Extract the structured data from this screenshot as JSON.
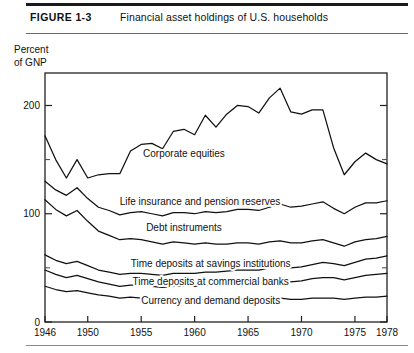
{
  "figure": {
    "number_label": "FIGURE 1-3",
    "title": "Financial asset holdings of U.S. households"
  },
  "chart_data": {
    "type": "area",
    "title": "Financial asset holdings of U.S. households",
    "subtitle": "",
    "xlabel": "",
    "ylabel": "Percent of GNP",
    "ylabel_display": "Percent\nof GNP",
    "xlim": [
      1946,
      1978
    ],
    "ylim": [
      0,
      230
    ],
    "grid": false,
    "legend_position": "inline-annotations",
    "ytick_labels": [
      "0",
      "100",
      "200"
    ],
    "ytick_values": [
      0,
      100,
      200
    ],
    "yminor_ticks": [
      50,
      150
    ],
    "xtick_labels": [
      "1946",
      "1950",
      "1955",
      "1960",
      "1965",
      "1970",
      "1975",
      "1978"
    ],
    "xtick_values": [
      1946,
      1950,
      1955,
      1960,
      1965,
      1970,
      1975,
      1978
    ],
    "x": [
      1946,
      1947,
      1948,
      1949,
      1950,
      1951,
      1952,
      1953,
      1954,
      1955,
      1956,
      1957,
      1958,
      1959,
      1960,
      1961,
      1962,
      1963,
      1964,
      1965,
      1966,
      1967,
      1968,
      1969,
      1970,
      1971,
      1972,
      1973,
      1974,
      1975,
      1976,
      1977,
      1978
    ],
    "note": "Cumulative boundary curves; each series value is the running top of the stacked band, in percent of GNP.",
    "series": [
      {
        "name": "Corporate equities",
        "label": "Corporate equities",
        "label_at": {
          "x": 1959.0,
          "y": 152
        },
        "cumulative_top": [
          172,
          150,
          133,
          150,
          133,
          136,
          137,
          137,
          158,
          164,
          165,
          160,
          176,
          178,
          173,
          191,
          180,
          192,
          200,
          199,
          193,
          207,
          216,
          194,
          192,
          196,
          196,
          161,
          136,
          148,
          156,
          150,
          146
        ]
      },
      {
        "name": "Life insurance and pension reserves",
        "label": "Life insurance and pension reserves",
        "label_at": {
          "x": 1960.5,
          "y": 108
        },
        "cumulative_top": [
          130,
          122,
          117,
          124,
          114,
          106,
          103,
          99,
          101,
          102,
          100,
          98,
          101,
          101,
          100,
          102,
          101,
          102,
          104,
          104,
          103,
          106,
          109,
          106,
          107,
          109,
          111,
          105,
          100,
          106,
          110,
          110,
          112
        ]
      },
      {
        "name": "Debt instruments",
        "label": "Debt instruments",
        "label_at": {
          "x": 1959.0,
          "y": 84
        },
        "cumulative_top": [
          113,
          104,
          98,
          103,
          93,
          84,
          80,
          76,
          77,
          76,
          74,
          72,
          74,
          73,
          72,
          73,
          72,
          72,
          73,
          73,
          72,
          74,
          75,
          73,
          73,
          75,
          76,
          73,
          70,
          74,
          76,
          77,
          79
        ]
      },
      {
        "name": "Time deposits at savings institutions",
        "label": "Time deposits at savings institutions",
        "label_at": {
          "x": 1961.5,
          "y": 51
        }
      },
      {
        "name": "Time deposits at commercial banks",
        "label": "Time deposits at commercial banks",
        "label_at": {
          "x": 1961.5,
          "y": 34
        }
      },
      {
        "name": "Currency and demand deposits",
        "label": "Currency and demand deposits",
        "label_at": {
          "x": 1961.5,
          "y": 17
        }
      }
    ],
    "band_tops": {
      "savings_institutions": [
        62,
        57,
        54,
        56,
        52,
        48,
        46,
        44,
        45,
        45,
        44,
        43,
        45,
        45,
        45,
        46,
        46,
        47,
        48,
        48,
        48,
        50,
        51,
        50,
        51,
        53,
        55,
        54,
        52,
        55,
        58,
        59,
        61
      ],
      "commercial_banks": [
        48,
        44,
        41,
        43,
        40,
        37,
        35,
        33,
        34,
        34,
        33,
        32,
        33,
        33,
        33,
        34,
        34,
        34,
        35,
        36,
        36,
        37,
        38,
        37,
        38,
        40,
        41,
        41,
        39,
        41,
        43,
        44,
        45
      ],
      "demand_deposits": [
        33,
        30,
        28,
        29,
        27,
        25,
        24,
        22,
        23,
        22,
        22,
        21,
        22,
        21,
        21,
        21,
        21,
        21,
        21,
        21,
        21,
        21,
        22,
        21,
        21,
        22,
        22,
        22,
        21,
        22,
        23,
        23,
        24
      ]
    },
    "colors": {
      "line": "#111111",
      "background": "#ffffff",
      "frame": "#333333"
    }
  }
}
